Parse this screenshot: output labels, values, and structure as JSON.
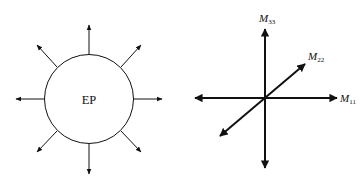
{
  "left_diagram": {
    "center_label": "EP",
    "arrow_directions": [
      "up",
      "up-right",
      "right",
      "down-right",
      "down",
      "down-left",
      "left",
      "up-left"
    ]
  },
  "right_diagram": {
    "axes": [
      {
        "id": "M11",
        "base": "M",
        "subscript": "11",
        "direction": "horizontal"
      },
      {
        "id": "M22",
        "base": "M",
        "subscript": "22",
        "direction": "diagonal"
      },
      {
        "id": "M33",
        "base": "M",
        "subscript": "33",
        "direction": "vertical"
      }
    ]
  },
  "colors": {
    "stroke": "#111111",
    "background": "#ffffff"
  }
}
